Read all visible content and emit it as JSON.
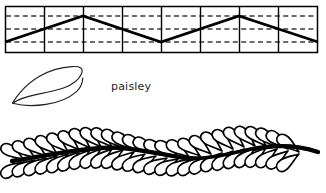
{
  "figure": {
    "background_color": "#ffffff",
    "ink_color": "#000000",
    "text_color": "#231f20",
    "width": 326,
    "height": 193
  },
  "panels": [
    {
      "id": "zigzag-grid",
      "name": "zigzag guide grid",
      "description": "Rectangular grid with vertical column dividers, dashed horizontal guide lines, and a bold zigzag line",
      "box": {
        "x": 5,
        "y": 6,
        "width": 313,
        "height": 47
      },
      "columns": 8,
      "column_divider_x": [
        44,
        83,
        122,
        161,
        200,
        239,
        278
      ],
      "dashed_guides_y": [
        16,
        29,
        42
      ],
      "grid_line_color": "#000000",
      "dashed_line_color": "#444444",
      "zigzag": {
        "line_color": "#000000",
        "line_width": 2.6,
        "points": [
          {
            "x": 5,
            "y": 42
          },
          {
            "x": 83,
            "y": 16
          },
          {
            "x": 161,
            "y": 42
          },
          {
            "x": 239,
            "y": 16
          },
          {
            "x": 318,
            "y": 42
          }
        ]
      }
    },
    {
      "id": "paisley-motif",
      "name": "single paisley teardrop motif",
      "description": "Outline of one paisley droplet with rounded bulb at right and curved tapering tail to the left",
      "box": {
        "x": 10,
        "y": 64,
        "width": 80,
        "height": 42
      },
      "stroke_color": "#231f20",
      "stroke_width": 1.1,
      "fill": "none"
    },
    {
      "id": "paisley-border",
      "name": "feather border of paisley leaves",
      "description": "Wavy stem with paisley-shaped leaves alternating above and below, forming a repeating border",
      "box": {
        "x": 8,
        "y": 128,
        "width": 312,
        "height": 62
      },
      "stem": {
        "color": "#000000",
        "width": 4.2,
        "wave_amplitude": 7,
        "wave_cycles": 2
      },
      "leaves": {
        "count_per_side": 26,
        "outline_color": "#000000",
        "outline_width": 1.6,
        "fill_color": "#ffffff",
        "leaf_length": 26,
        "leaf_width": 11
      }
    }
  ],
  "labels": {
    "paisley": "paisley"
  }
}
